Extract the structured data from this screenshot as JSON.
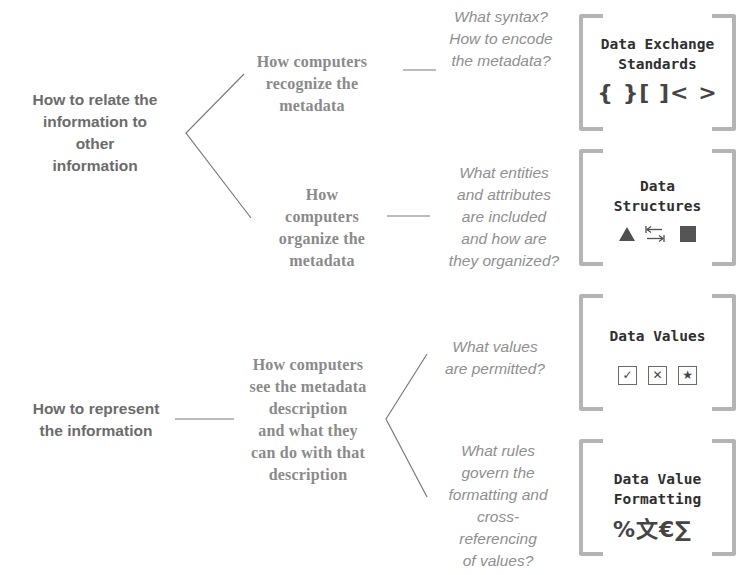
{
  "diagram": {
    "colors": {
      "root_text": "#6b6b6b",
      "mid_text": "#8a8a8a",
      "question_text": "#8f8f8f",
      "box_title": "#2f2f2f",
      "bracket": "#b4b4b4",
      "line": "#7a7a7a"
    },
    "groups": [
      {
        "root": {
          "lines": [
            "How to relate the",
            "information to",
            "other",
            "information"
          ]
        },
        "branches": [
          {
            "mid": {
              "lines": [
                "How computers",
                "recognize the",
                "metadata"
              ]
            },
            "question": {
              "lines": [
                "What syntax?",
                "How to encode",
                "the metadata?"
              ]
            },
            "box": {
              "title": "Data Exchange\nStandards",
              "icons": "{ }[ ]< >",
              "icon_names": [
                "curly-braces-icon",
                "square-brackets-icon",
                "angle-brackets-icon"
              ]
            }
          },
          {
            "mid": {
              "lines": [
                "How",
                "computers",
                "organize the",
                "metadata"
              ]
            },
            "question": {
              "lines": [
                "What entities",
                "and attributes",
                "are included",
                "and how are",
                "they organized?"
              ]
            },
            "box": {
              "title": "Data\nStructures",
              "icon_names": [
                "triangle-icon",
                "tab-arrows-icon",
                "filled-square-icon"
              ]
            }
          }
        ]
      },
      {
        "root": {
          "lines": [
            "How to represent",
            "the information"
          ]
        },
        "mid": {
          "lines": [
            "How computers",
            "see the metadata",
            "description",
            "and what they",
            "can do with that",
            "description"
          ]
        },
        "branches": [
          {
            "question": {
              "lines": [
                "What values",
                "are permitted?"
              ]
            },
            "box": {
              "title": "Data Values",
              "icons": [
                "✓",
                "✕",
                "★"
              ],
              "icon_names": [
                "checkbox-check-icon",
                "checkbox-x-icon",
                "checkbox-star-icon"
              ]
            }
          },
          {
            "question": {
              "lines": [
                "What rules",
                "govern the",
                "formatting and",
                "cross-",
                "referencing",
                "of values?"
              ]
            },
            "box": {
              "title": "Data Value\nFormatting",
              "icons": "%文€∑",
              "icon_names": [
                "percent-icon",
                "language-character-icon",
                "euro-icon",
                "sigma-icon"
              ]
            }
          }
        ]
      }
    ]
  }
}
